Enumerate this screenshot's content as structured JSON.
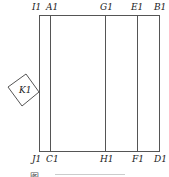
{
  "figure": {
    "top_labels": [
      {
        "text": "I1",
        "x": 36
      },
      {
        "text": "A1",
        "x": 50
      },
      {
        "text": "G1",
        "x": 105
      },
      {
        "text": "E1",
        "x": 136
      },
      {
        "text": "B1",
        "x": 159
      }
    ],
    "bottom_labels": [
      {
        "text": "J1",
        "x": 36
      },
      {
        "text": "C1",
        "x": 50
      },
      {
        "text": "H1",
        "x": 104
      },
      {
        "text": "F1",
        "x": 137
      },
      {
        "text": "D1",
        "x": 159
      }
    ],
    "rotated_square_label": "K1",
    "caption": "图"
  }
}
